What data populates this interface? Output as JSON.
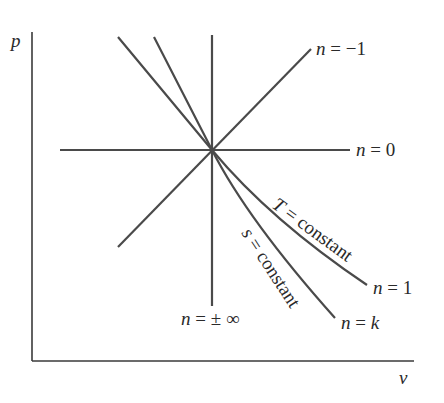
{
  "figure": {
    "type": "polytropic-process-diagram",
    "axes": {
      "y_label": "p",
      "x_label": "v"
    },
    "curves": [
      {
        "id": "n-minus-1",
        "label_n": "n",
        "label_eq": " = ",
        "label_val": "−1",
        "kind": "line",
        "description": "rising line"
      },
      {
        "id": "n-0",
        "label_n": "n",
        "label_eq": " = ",
        "label_val": "0",
        "kind": "line",
        "description": "horizontal line (constant pressure)"
      },
      {
        "id": "n-1",
        "label_n": "n",
        "label_eq": " = ",
        "label_val": "1",
        "kind": "curve",
        "curve_label": "T = constant"
      },
      {
        "id": "n-k",
        "label_n": "n",
        "label_eq": " = ",
        "label_val": "k",
        "kind": "curve",
        "curve_label": "s = constant"
      },
      {
        "id": "n-inf",
        "label_n": "n",
        "label_eq": " = ",
        "label_val": "± ∞",
        "kind": "line",
        "description": "vertical line (constant volume)"
      }
    ],
    "curve_labels": {
      "isothermal_var": "T",
      "isothermal_rest": " = constant",
      "isentropic_var": "s",
      "isentropic_rest": " = constant"
    },
    "colors": {
      "line": "#4a4a4a",
      "axis": "#3a3a3a",
      "text": "#2a2a2a",
      "background": "#ffffff"
    }
  }
}
